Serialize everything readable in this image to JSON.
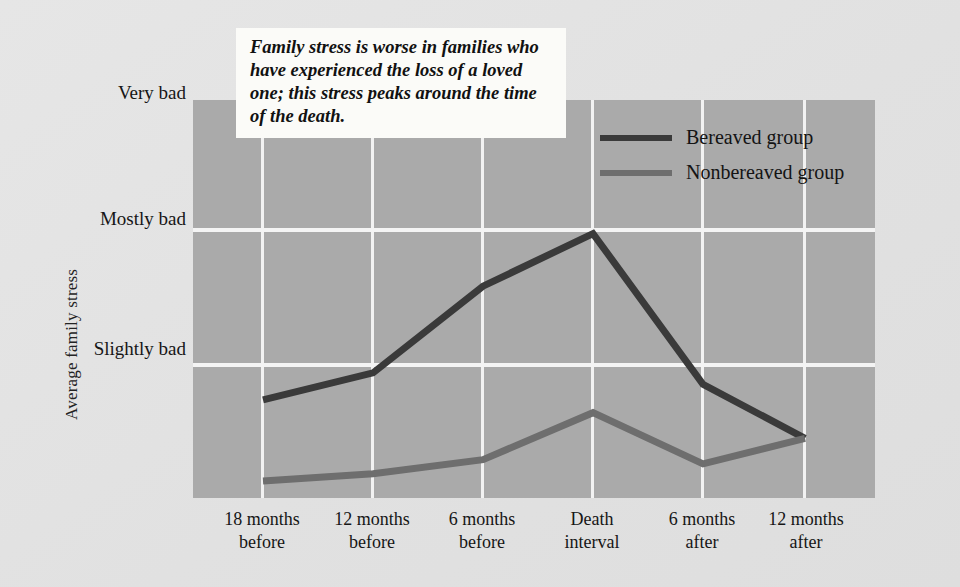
{
  "annotation": {
    "text": "Family stress is worse in families who have experienced the loss of a loved one; this stress peaks around the time of the death."
  },
  "legend": {
    "position": "inside-top-right",
    "entries": [
      {
        "label": "Bereaved group",
        "color": "#3a3a3a"
      },
      {
        "label": "Nonbereaved group",
        "color": "#6e6e6e"
      }
    ]
  },
  "axes": {
    "y_title": "Average family stress",
    "y_ticks": [
      {
        "label_line1": "Very",
        "label_line2": "bad"
      },
      {
        "label_line1": "Mostly",
        "label_line2": "bad"
      },
      {
        "label_line1": "Slightly",
        "label_line2": "bad"
      }
    ],
    "x_ticks": [
      {
        "line1": "18 months",
        "line2": "before"
      },
      {
        "line1": "12 months",
        "line2": "before"
      },
      {
        "line1": "6 months",
        "line2": "before"
      },
      {
        "line1": "Death",
        "line2": "interval"
      },
      {
        "line1": "6 months",
        "line2": "after"
      },
      {
        "line1": "12 months",
        "line2": "after"
      }
    ]
  },
  "colors": {
    "figure_background": "#e4e4e4",
    "plot_background": "#aaaaaa",
    "gridline": "#f4f4f4",
    "bereaved": "#3a3a3a",
    "nonbereaved": "#6e6e6e",
    "annotation_background": "#fbfbf8"
  },
  "chart_data": {
    "type": "line",
    "title": "",
    "xlabel": "",
    "ylabel": "Average family stress",
    "categories": [
      "18 months before",
      "12 months before",
      "6 months before",
      "Death interval",
      "6 months after",
      "12 months after"
    ],
    "y_axis": {
      "kind": "ordinal-scale",
      "tick_labels": [
        "Very bad",
        "Mostly bad",
        "Slightly bad"
      ],
      "tick_values": [
        3.0,
        2.0,
        1.0
      ],
      "range": [
        0.45,
        3.25
      ],
      "note": "Higher on the axis means worse family stress."
    },
    "grid": {
      "vertical": true,
      "horizontal": true
    },
    "legend_position": "inside top right",
    "series": [
      {
        "name": "Bereaved group",
        "color": "#3a3a3a",
        "values": [
          1.14,
          1.33,
          1.94,
          2.31,
          1.25,
          0.87
        ]
      },
      {
        "name": "Nonbereaved group",
        "color": "#6e6e6e",
        "values": [
          0.57,
          0.62,
          0.72,
          1.05,
          0.69,
          0.87
        ]
      }
    ],
    "annotations": [
      {
        "text": "Family stress is worse in families who have experienced the loss of a loved one; this stress peaks around the time of the death.",
        "placement": "top-left-overlay"
      }
    ]
  },
  "_geometry": {
    "plot": {
      "left": 193,
      "top": 100,
      "width": 682,
      "height": 398
    },
    "category_x": [
      70,
      180,
      290,
      400,
      510,
      612
    ],
    "gridlines_y": [
      130,
      265
    ],
    "series_pixel_y": {
      "bereaved": [
        245,
        220,
        140,
        90,
        231,
        282
      ],
      "nonbereaved": [
        319,
        315,
        302,
        258,
        305,
        282
      ]
    }
  }
}
